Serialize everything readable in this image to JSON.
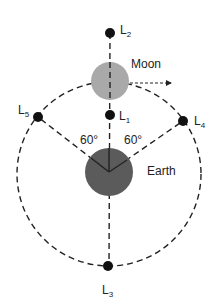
{
  "diagram": {
    "bodies": {
      "moon": {
        "label": "Moon",
        "color": "#a9a9a9"
      },
      "earth": {
        "label": "Earth",
        "color": "#5b5b5b"
      }
    },
    "lagrange_points": [
      {
        "id": "L2",
        "letter": "L",
        "sub": "2"
      },
      {
        "id": "L1",
        "letter": "L",
        "sub": "1"
      },
      {
        "id": "L3",
        "letter": "L",
        "sub": "3"
      },
      {
        "id": "L4",
        "letter": "L",
        "sub": "4"
      },
      {
        "id": "L5",
        "letter": "L",
        "sub": "5"
      }
    ],
    "angles": {
      "left": "60°",
      "right": "60°"
    }
  }
}
